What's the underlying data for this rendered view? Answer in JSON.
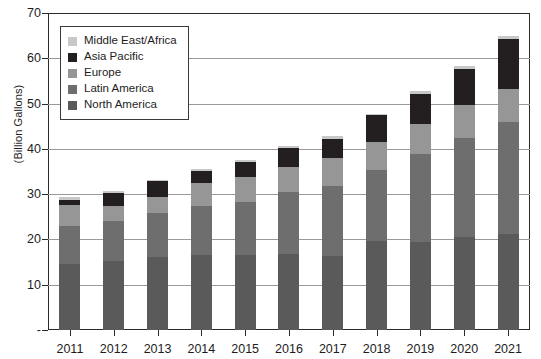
{
  "chart_data": {
    "type": "bar",
    "stacked": true,
    "title": "",
    "subtitle": "",
    "xlabel": "",
    "ylabel": "(Billion Gallons)",
    "categories": [
      "2011",
      "2012",
      "2013",
      "2014",
      "2015",
      "2016",
      "2017",
      "2018",
      "2019",
      "2020",
      "2021"
    ],
    "ylim": [
      0,
      70
    ],
    "yticks": [
      0,
      10,
      20,
      30,
      40,
      50,
      60,
      70
    ],
    "ytick_labels": [
      "-",
      "10",
      "20",
      "30",
      "40",
      "50",
      "60",
      "70"
    ],
    "grid": true,
    "legend_position": "upper-left",
    "series": [
      {
        "name": "North America",
        "color": "#5a5a5a",
        "values": [
          14.5,
          15.2,
          16.1,
          16.5,
          16.5,
          16.7,
          16.3,
          19.6,
          19.4,
          20.5,
          21.3
        ]
      },
      {
        "name": "Latin America",
        "color": "#6e6e6e",
        "values": [
          8.5,
          8.9,
          9.7,
          10.8,
          11.8,
          13.8,
          15.4,
          15.8,
          19.4,
          21.8,
          24.7
        ]
      },
      {
        "name": "Europe",
        "color": "#969696",
        "values": [
          4.5,
          3.3,
          3.6,
          5.1,
          5.6,
          5.6,
          6.2,
          6.1,
          6.6,
          7.4,
          7.3
        ]
      },
      {
        "name": "Asia Pacific",
        "color": "#231f20",
        "values": [
          1.3,
          2.8,
          3.4,
          2.7,
          3.2,
          4.0,
          4.3,
          5.9,
          6.8,
          8.0,
          10.9
        ]
      },
      {
        "name": "Middle East/Africa",
        "color": "#c8c8c8",
        "values": [
          0.5,
          0.4,
          0.4,
          0.5,
          0.5,
          0.5,
          0.6,
          0.4,
          0.7,
          0.7,
          0.7
        ]
      }
    ],
    "totals": [
      29.3,
      30.6,
      33.2,
      35.6,
      37.6,
      40.6,
      42.8,
      47.8,
      52.9,
      58.4,
      64.9
    ]
  },
  "legend": {
    "items": [
      {
        "label": "Middle East/Africa",
        "color": "#c8c8c8"
      },
      {
        "label": "Asia Pacific",
        "color": "#231f20"
      },
      {
        "label": "Europe",
        "color": "#969696"
      },
      {
        "label": "Latin America",
        "color": "#6e6e6e"
      },
      {
        "label": "North America",
        "color": "#5a5a5a"
      }
    ]
  },
  "axis": {
    "y_title": "(Billion Gallons)"
  },
  "colors": {
    "axis_line": "#2b2b2b",
    "gridline": "#9a9a9a",
    "background": "#ffffff",
    "text": "#1d1d1d"
  }
}
